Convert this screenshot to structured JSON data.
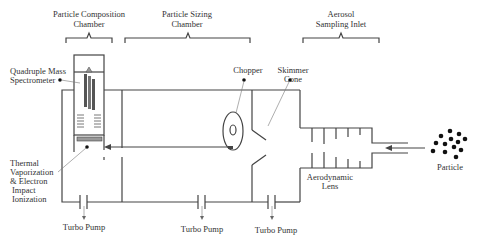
{
  "diagram": {
    "sections": [
      {
        "id": "composition",
        "line1": "Particle Composition",
        "line2": "Chamber"
      },
      {
        "id": "sizing",
        "line1": "Particle Sizing",
        "line2": "Chamber"
      },
      {
        "id": "inlet",
        "line1": "Aerosol",
        "line2": "Sampling Inlet"
      }
    ],
    "components": {
      "qms": {
        "line1": "Quadruple Mass",
        "line2": "Spectrometer"
      },
      "vaporization": {
        "line1": "Thermal",
        "line2": "Vaporization",
        "line3": "& Electron",
        "line4": "Impact",
        "line5": "Ionization"
      },
      "chopper": "Chopper",
      "skimmer": {
        "line1": "Skimmer",
        "line2": "Cone"
      },
      "lens": {
        "line1": "Aerodynamic",
        "line2": "Lens"
      },
      "particle": "Particle"
    },
    "pumps": [
      "Turbo Pump",
      "Turbo Pump",
      "Turbo Pump"
    ],
    "colors": {
      "line": "#444444",
      "text": "#333333",
      "rod": "#555555",
      "heater": "#888888"
    }
  }
}
